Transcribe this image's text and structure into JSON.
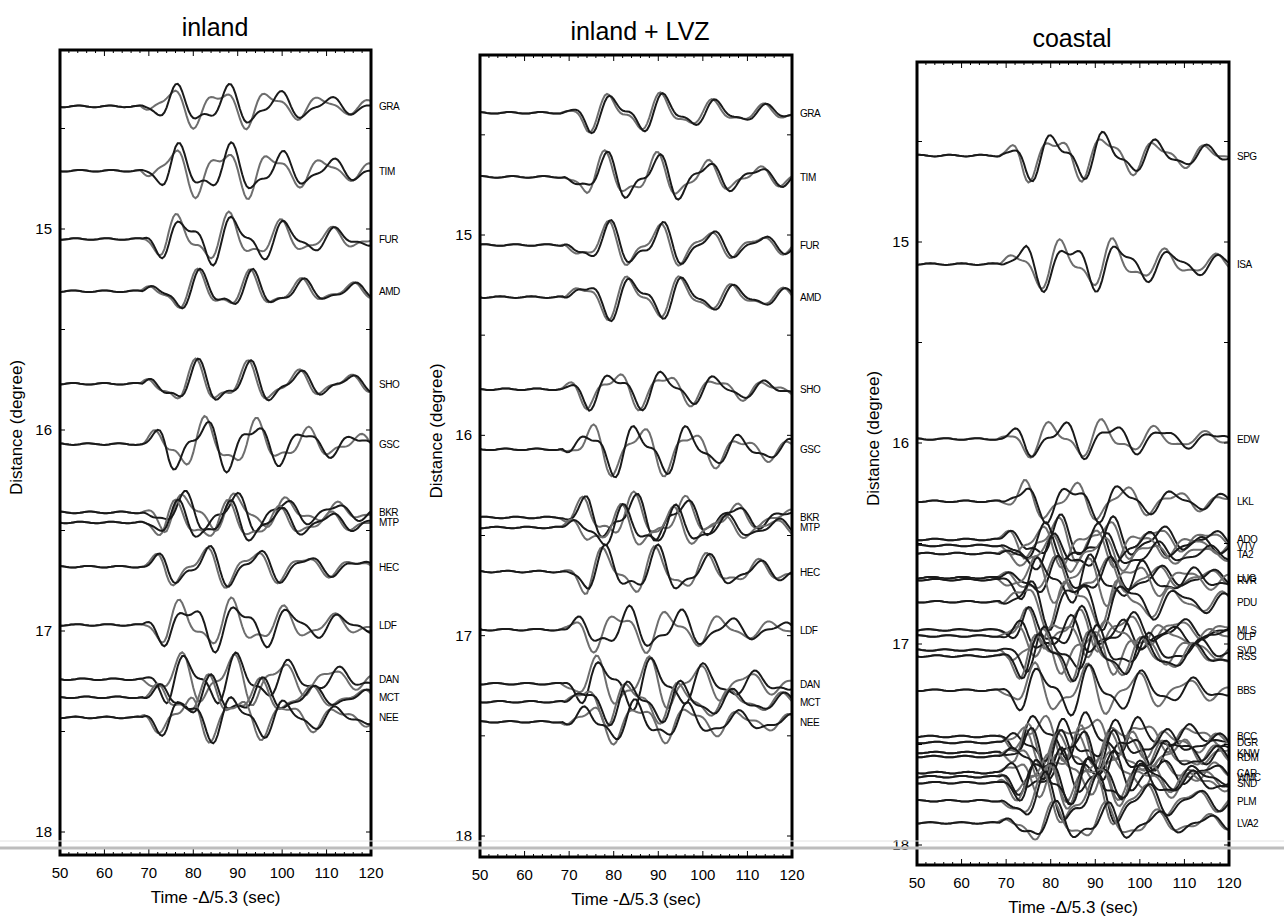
{
  "figure": {
    "scan_lines": [
      {
        "y": 848,
        "color": "#bdbdbd",
        "width": 3
      },
      {
        "y": 841,
        "color": "#e2e2e2",
        "width": 1
      }
    ]
  },
  "chart_data": [
    {
      "type": "line",
      "title": "inland",
      "xlabel": "Time -Δ/5.3 (sec)",
      "ylabel": "Distance (degree)",
      "xlim": [
        50,
        120
      ],
      "ylim": [
        14.1,
        18.1
      ],
      "y_inverted": true,
      "xticks": [
        50,
        60,
        70,
        80,
        90,
        100,
        110,
        120
      ],
      "yticks": [
        15,
        16,
        17,
        18
      ],
      "grid": false,
      "legend": null,
      "series_styles": {
        "observed": "#1a1a1a",
        "synthetic": "#6e6e6e"
      },
      "frame": {
        "x0": 60,
        "x1": 371,
        "y0": 50,
        "y1": 855,
        "y15": 229,
        "y18": 832,
        "title_y": 36,
        "title_x": 215
      },
      "stations": [
        {
          "name": "GRA",
          "distance": 14.39
        },
        {
          "name": "TIM",
          "distance": 14.71
        },
        {
          "name": "FUR",
          "distance": 15.05
        },
        {
          "name": "AMD",
          "distance": 15.31
        },
        {
          "name": "SHO",
          "distance": 15.77
        },
        {
          "name": "GSC",
          "distance": 16.07
        },
        {
          "name": "BKR",
          "distance": 16.41
        },
        {
          "name": "MTP",
          "distance": 16.46
        },
        {
          "name": "HEC",
          "distance": 16.68
        },
        {
          "name": "LDF",
          "distance": 16.97
        },
        {
          "name": "DAN",
          "distance": 17.24
        },
        {
          "name": "MCT",
          "distance": 17.33
        },
        {
          "name": "NEE",
          "distance": 17.43
        }
      ]
    },
    {
      "type": "line",
      "title": "inland + LVZ",
      "xlabel": "Time -Δ/5.3 (sec)",
      "ylabel": "Distance (degree)",
      "xlim": [
        50,
        120
      ],
      "ylim": [
        14.1,
        18.1
      ],
      "y_inverted": true,
      "xticks": [
        50,
        60,
        70,
        80,
        90,
        100,
        110,
        120
      ],
      "yticks": [
        15,
        16,
        17,
        18
      ],
      "grid": false,
      "legend": null,
      "series_styles": {
        "observed": "#1a1a1a",
        "synthetic": "#6e6e6e"
      },
      "frame": {
        "x0": 480,
        "x1": 792,
        "y0": 55,
        "y1": 857,
        "y15": 235,
        "y18": 836,
        "title_y": 40,
        "title_x": 640
      },
      "stations": [
        {
          "name": "GRA",
          "distance": 14.39
        },
        {
          "name": "TIM",
          "distance": 14.71
        },
        {
          "name": "FUR",
          "distance": 15.05
        },
        {
          "name": "AMD",
          "distance": 15.31
        },
        {
          "name": "SHO",
          "distance": 15.77
        },
        {
          "name": "GSC",
          "distance": 16.07
        },
        {
          "name": "BKR",
          "distance": 16.41
        },
        {
          "name": "MTP",
          "distance": 16.46
        },
        {
          "name": "HEC",
          "distance": 16.68
        },
        {
          "name": "LDF",
          "distance": 16.97
        },
        {
          "name": "DAN",
          "distance": 17.24
        },
        {
          "name": "MCT",
          "distance": 17.33
        },
        {
          "name": "NEE",
          "distance": 17.43
        }
      ]
    },
    {
      "type": "line",
      "title": "coastal",
      "xlabel": "Time -Δ/5.3 (sec)",
      "ylabel": "Distance (degree)",
      "xlim": [
        50,
        120
      ],
      "ylim": [
        14.1,
        18.1
      ],
      "y_inverted": true,
      "xticks": [
        50,
        60,
        70,
        80,
        90,
        100,
        110,
        120
      ],
      "yticks": [
        15,
        16,
        17,
        18
      ],
      "grid": false,
      "legend": null,
      "series_styles": {
        "observed": "#1a1a1a",
        "synthetic": "#6e6e6e"
      },
      "frame": {
        "x0": 917,
        "x1": 1229,
        "y0": 62,
        "y1": 865,
        "y15": 242,
        "y18": 845,
        "title_y": 47,
        "title_x": 1072
      },
      "stations": [
        {
          "name": "SPG",
          "distance": 14.57
        },
        {
          "name": "ISA",
          "distance": 15.11
        },
        {
          "name": "EDW",
          "distance": 15.98
        },
        {
          "name": "LKL",
          "distance": 16.29
        },
        {
          "name": "ADO",
          "distance": 16.48
        },
        {
          "name": "VTV",
          "distance": 16.51
        },
        {
          "name": "TA2",
          "distance": 16.55
        },
        {
          "name": "LUG",
          "distance": 16.67
        },
        {
          "name": "RVR",
          "distance": 16.68
        },
        {
          "name": "PDU",
          "distance": 16.79
        },
        {
          "name": "MLS",
          "distance": 16.93
        },
        {
          "name": "OLP",
          "distance": 16.96
        },
        {
          "name": "SVD",
          "distance": 17.03
        },
        {
          "name": "RSS",
          "distance": 17.06
        },
        {
          "name": "BBS",
          "distance": 17.23
        },
        {
          "name": "BCC",
          "distance": 17.46
        },
        {
          "name": "DGR",
          "distance": 17.49
        },
        {
          "name": "KNW",
          "distance": 17.54
        },
        {
          "name": "RDM",
          "distance": 17.56
        },
        {
          "name": "CAR",
          "distance": 17.64
        },
        {
          "name": "WMC",
          "distance": 17.66
        },
        {
          "name": "SND",
          "distance": 17.69
        },
        {
          "name": "PLM",
          "distance": 17.78
        },
        {
          "name": "LVA2",
          "distance": 17.89
        }
      ]
    }
  ]
}
